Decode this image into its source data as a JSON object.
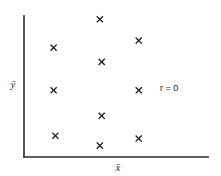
{
  "chart_data": {
    "type": "scatter",
    "title": "",
    "xlabel": "x̄",
    "ylabel": "ȳ",
    "annotation": "r = 0",
    "grid": false,
    "legend": null,
    "xlim": [
      0,
      10
    ],
    "ylim": [
      0,
      10
    ],
    "x_ticks": [],
    "y_ticks": [],
    "marker": "x",
    "series": [
      {
        "name": "points",
        "points": [
          {
            "x": 1.6,
            "y": 7.7
          },
          {
            "x": 4.1,
            "y": 9.7
          },
          {
            "x": 6.2,
            "y": 8.2
          },
          {
            "x": 4.2,
            "y": 6.7
          },
          {
            "x": 1.6,
            "y": 4.7
          },
          {
            "x": 6.2,
            "y": 4.7
          },
          {
            "x": 4.2,
            "y": 2.9
          },
          {
            "x": 1.7,
            "y": 1.5
          },
          {
            "x": 4.1,
            "y": 0.8
          },
          {
            "x": 6.2,
            "y": 1.3
          }
        ]
      }
    ]
  },
  "labels": {
    "x_axis": "x̄",
    "y_axis": "ȳ",
    "correlation": "r = 0"
  },
  "colors": {
    "axis": "#2a2a2a",
    "marker": "#1a1a1a",
    "background": "#ffffff"
  },
  "layout": {
    "plot": {
      "x0": 24,
      "x1": 209,
      "y0": 157,
      "y1": 15
    }
  }
}
